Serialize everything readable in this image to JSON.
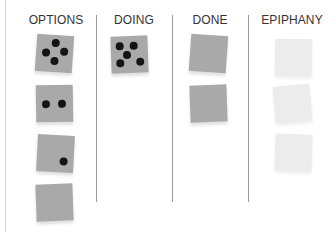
{
  "board": {
    "columns": [
      {
        "title": "OPTIONS",
        "cards": [
          {
            "style": "gray",
            "dots": 4
          },
          {
            "style": "gray",
            "dots": 2
          },
          {
            "style": "gray",
            "dots": 1
          },
          {
            "style": "gray",
            "dots": 0
          }
        ]
      },
      {
        "title": "DOING",
        "cards": [
          {
            "style": "gray",
            "dots": 5
          }
        ]
      },
      {
        "title": "DONE",
        "cards": [
          {
            "style": "gray",
            "dots": 0
          },
          {
            "style": "gray",
            "dots": 0
          }
        ]
      },
      {
        "title": "EPIPHANY",
        "cards": [
          {
            "style": "light",
            "dots": 0
          },
          {
            "style": "light",
            "dots": 0
          },
          {
            "style": "light",
            "dots": 0
          }
        ]
      }
    ],
    "colors": {
      "card_gray": "#a9a9a9",
      "card_light": "#ececec",
      "dot": "#141414",
      "divider": "#9a9a9a",
      "text": "#333333"
    }
  }
}
